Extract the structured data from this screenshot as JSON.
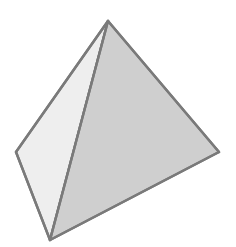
{
  "figure": {
    "name": "tetrahedron",
    "title_fragment": "...",
    "background_color": "#ffffff",
    "edge_color": "#7a7a7a",
    "edge_width": 2.4,
    "hidden_edge_color": "#8a8a8a",
    "hidden_edge_width": 2.4,
    "hidden_edge_dash": "9 8",
    "vertices": {
      "apex": {
        "label": "apex",
        "x": 108,
        "y": 21
      },
      "left": {
        "label": "left-vertex",
        "x": 16,
        "y": 152
      },
      "right": {
        "label": "right-vertex",
        "x": 219,
        "y": 152
      },
      "front": {
        "label": "front-vertex",
        "x": 50,
        "y": 240
      }
    },
    "faces": [
      {
        "name": "upper-left-face",
        "fill": "#eeeeee",
        "points": "108,21 16,152 50,240",
        "visible": true
      },
      {
        "name": "front-right-face",
        "fill": "#cfcfcf",
        "points": "108,21 219,152 50,240",
        "visible": true
      },
      {
        "name": "lower-left-face",
        "fill": "#e6e6e6",
        "points": "16,152 219,152 50,240",
        "visible": false
      }
    ],
    "edges": [
      {
        "name": "edge-apex-left",
        "points": "108,21 16,152",
        "style": "solid"
      },
      {
        "name": "edge-apex-right",
        "points": "108,21 219,152",
        "style": "solid"
      },
      {
        "name": "edge-apex-front",
        "points": "108,21 50,240",
        "style": "solid"
      },
      {
        "name": "edge-left-front",
        "points": "16,152 50,240",
        "style": "solid"
      },
      {
        "name": "edge-right-front",
        "points": "219,152 50,240",
        "style": "solid"
      },
      {
        "name": "edge-left-right",
        "points": "16,152 219,152",
        "style": "dashed"
      }
    ]
  }
}
